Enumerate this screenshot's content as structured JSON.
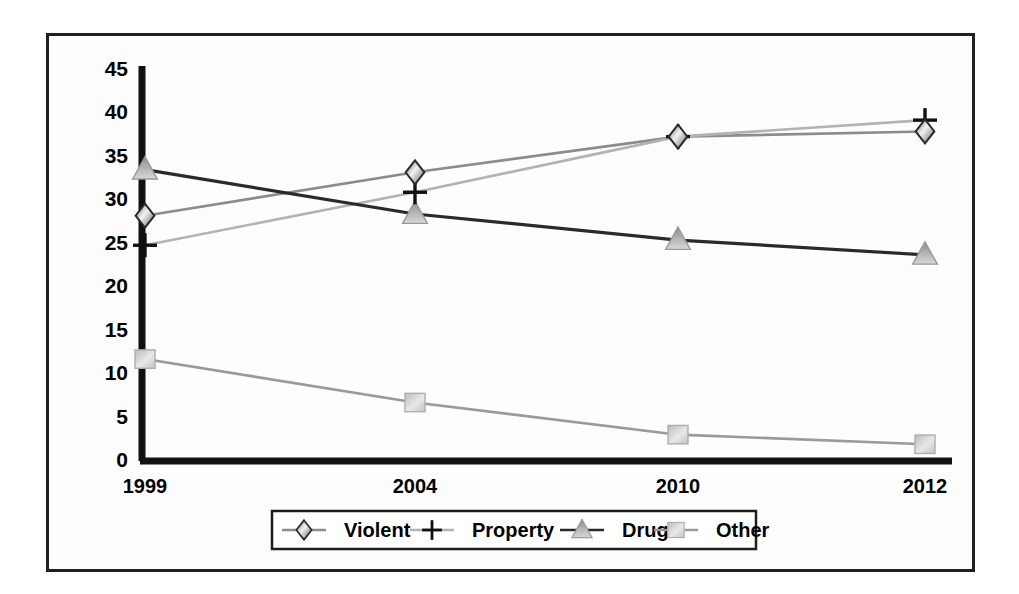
{
  "figure": {
    "background_color": "#ffffff",
    "plot_background_color": "#fdfdfd",
    "frame_color": "#231f20"
  },
  "chart_data": {
    "type": "line",
    "title": "",
    "subtitle": "",
    "xlabel": "",
    "ylabel": "",
    "categories": [
      "1999",
      "2004",
      "2010",
      "2012"
    ],
    "ylim": [
      0,
      45
    ],
    "ytick_step": 5,
    "yticks": [
      "45",
      "40",
      "35",
      "30",
      "25",
      "20",
      "15",
      "10",
      "5",
      "0"
    ],
    "grid": false,
    "legend_position": "bottom",
    "series": [
      {
        "name": "Violent",
        "marker": "diamond",
        "color": "#8c8c8c",
        "marker_fill": "#7a7a7a",
        "marker_stroke": "#2b2b2b",
        "values": [
          28.0,
          33.0,
          37.1,
          37.7
        ]
      },
      {
        "name": "Property",
        "marker": "plus",
        "color": "#b3b3b3",
        "marker_fill": "#111111",
        "marker_stroke": "#111111",
        "values": [
          24.6,
          30.7,
          37.1,
          39.0
        ]
      },
      {
        "name": "Drug",
        "marker": "triangle",
        "color": "#2a2a2a",
        "marker_fill": "#b0b0b0",
        "marker_stroke": "#8f8f8f",
        "values": [
          33.3,
          28.2,
          25.2,
          23.5
        ]
      },
      {
        "name": "Other",
        "marker": "square",
        "color": "#9a9a9a",
        "marker_fill": "#c9c9c9",
        "marker_stroke": "#a8a8a8",
        "values": [
          11.5,
          6.5,
          2.8,
          1.7
        ]
      }
    ]
  },
  "legend": {
    "items": [
      {
        "label": "Violent",
        "marker": "diamond"
      },
      {
        "label": "Property",
        "marker": "plus"
      },
      {
        "label": "Drug",
        "marker": "triangle"
      },
      {
        "label": "Other",
        "marker": "square"
      }
    ]
  }
}
